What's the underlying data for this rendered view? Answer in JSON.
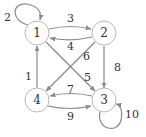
{
  "diagram": {
    "type": "directed-graph",
    "colors": {
      "node_stroke": "#b8b8b8",
      "edge": "#8a8a8a",
      "text": "#333333",
      "background": "#ffffff"
    },
    "nodes": [
      {
        "id": "1",
        "label": "1",
        "x": 37,
        "y": 33
      },
      {
        "id": "2",
        "label": "2",
        "x": 104,
        "y": 33
      },
      {
        "id": "3",
        "label": "3",
        "x": 104,
        "y": 100
      },
      {
        "id": "4",
        "label": "4",
        "x": 37,
        "y": 100
      }
    ],
    "edges": [
      {
        "from": "4",
        "to": "1",
        "label": "1"
      },
      {
        "from": "1",
        "to": "1",
        "label": "2"
      },
      {
        "from": "1",
        "to": "2",
        "label": "3"
      },
      {
        "from": "2",
        "to": "1",
        "label": "4"
      },
      {
        "from": "1",
        "to": "3",
        "label": "5"
      },
      {
        "from": "2",
        "to": "4",
        "label": "6"
      },
      {
        "from": "3",
        "to": "4",
        "label": "7"
      },
      {
        "from": "2",
        "to": "3",
        "label": "8"
      },
      {
        "from": "4",
        "to": "3",
        "label": "9"
      },
      {
        "from": "3",
        "to": "3",
        "label": "10"
      }
    ]
  }
}
